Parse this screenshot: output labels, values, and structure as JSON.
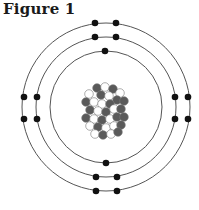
{
  "figure": {
    "title": "Figure 1",
    "colors": {
      "ring": "#555555",
      "electron": "#111111",
      "proton": "#5a5a5a",
      "neutron": "#ffffff"
    },
    "shells": [
      {
        "name": "inner",
        "radius": 56,
        "electrons": 2
      },
      {
        "name": "middle",
        "radius": 70,
        "electrons": 8
      },
      {
        "name": "outer",
        "radius": 84,
        "electrons": 8
      }
    ]
  }
}
